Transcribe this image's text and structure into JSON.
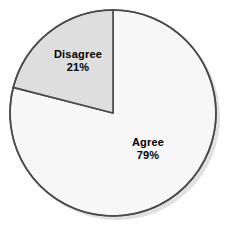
{
  "chart_data": {
    "type": "pie",
    "title": "",
    "subtitle": "",
    "xlabel": "",
    "ylabel": "",
    "legend_position": "none",
    "grid": false,
    "labels_inside_slices": true,
    "start_angle_deg": 0,
    "direction": "counterclockwise",
    "categories": [
      "Disagree",
      "Agree"
    ],
    "values": [
      21,
      79
    ],
    "value_suffix": "%",
    "slices": [
      {
        "label": "Disagree",
        "value": 21,
        "value_text": "21%",
        "color": "#dedede",
        "start_angle_deg": 0,
        "sweep_angle_deg": 75.6
      },
      {
        "label": "Agree",
        "value": 79,
        "value_text": "79%",
        "color": "#f7f7f7",
        "start_angle_deg": 75.6,
        "sweep_angle_deg": 284.4
      }
    ]
  },
  "style": {
    "background": "#ffffff",
    "outline_color": "#4a4a4a",
    "divider_color": "#4a4a4a",
    "shadow_color": "#c9c9c9",
    "label_color": "#000000"
  }
}
